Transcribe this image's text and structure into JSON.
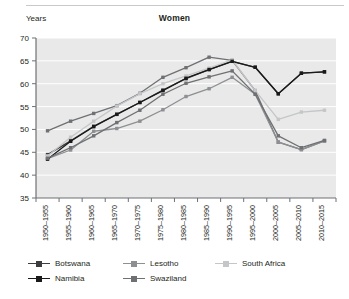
{
  "header": {
    "axis_corner_label": "Years",
    "title": "Women"
  },
  "legend": {
    "position": "bottom-left",
    "rows": [
      [
        {
          "label": "Botswana",
          "color": "#3d3d3f"
        },
        {
          "label": "Lesotho",
          "color": "#8d8f92"
        },
        {
          "label": "South Africa",
          "color": "#c4c6c8"
        }
      ],
      [
        {
          "label": "Namibia",
          "color": "#1a1a1a"
        },
        {
          "label": "Swaziland",
          "color": "#6e7073"
        }
      ]
    ]
  },
  "chart_data": {
    "type": "line",
    "title": "Women",
    "xlabel": "",
    "ylabel": "Years",
    "ylim": [
      35,
      70
    ],
    "yticks": [
      35,
      40,
      45,
      50,
      55,
      60,
      65,
      70
    ],
    "grid": true,
    "categories": [
      "1950–1955",
      "1955–1960",
      "1960–1965",
      "1965–1970",
      "1970–1975",
      "1975–1980",
      "1980–1985",
      "1985–1990",
      "1990–1995",
      "1995–2000",
      "2000–2005",
      "2005–2010",
      "2010–2015"
    ],
    "series": [
      {
        "name": "Botswana",
        "color": "#3d3d3f",
        "values": [
          44.5,
          47.5,
          50.7,
          53.3,
          55.9,
          58.6,
          61.1,
          63.1,
          64.9,
          63.6,
          57.8,
          62.3,
          62.6
        ]
      },
      {
        "name": "Lesotho",
        "color": "#8d8f92",
        "values": [
          43.6,
          45.5,
          49.6,
          50.2,
          51.8,
          54.3,
          57.2,
          58.9,
          61.4,
          57.7,
          47.2,
          45.6,
          47.5
        ]
      },
      {
        "name": "South Africa",
        "color": "#c4c6c8",
        "values": [
          44.2,
          48.3,
          51.8,
          55.1,
          57.8,
          60.0,
          61.7,
          63.4,
          65.2,
          58.5,
          52.2,
          53.8,
          54.2
        ]
      },
      {
        "name": "Namibia",
        "color": "#1a1a1a",
        "values": [
          43.5,
          47.4,
          50.6,
          53.3,
          55.9,
          58.5,
          61.2,
          63.1,
          64.9,
          63.6,
          57.8,
          62.3,
          62.6
        ]
      },
      {
        "name": "Swaziland",
        "color": "#6e7073",
        "values": [
          43.7,
          46.0,
          48.6,
          51.5,
          54.2,
          57.7,
          60.1,
          61.5,
          62.8,
          57.7,
          48.6,
          46.0,
          47.6
        ]
      }
    ],
    "highlight_series": [
      {
        "name": "Botswana-upper",
        "color": "#6e7073",
        "values": [
          49.7,
          51.8,
          53.5,
          55.2,
          57.9,
          61.4,
          63.5,
          65.8,
          65.1,
          58.5,
          47.2,
          45.6,
          47.5
        ]
      }
    ]
  }
}
